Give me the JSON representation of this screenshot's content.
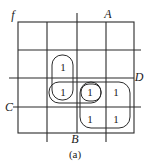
{
  "diagram": {
    "type": "karnaugh-map",
    "function_label": "f",
    "caption": "(a)",
    "variables": {
      "A": "A",
      "B": "B",
      "C": "C",
      "D": "D"
    },
    "grid": {
      "rows": 4,
      "cols": 4,
      "cells": [
        [
          "",
          "",
          "",
          ""
        ],
        [
          "",
          "1",
          "",
          ""
        ],
        [
          "",
          "1",
          "1",
          "1"
        ],
        [
          "",
          "",
          "1",
          "1"
        ]
      ]
    },
    "groupings": [
      {
        "name": "vertical-pair",
        "cells": [
          [
            1,
            1
          ],
          [
            2,
            1
          ]
        ]
      },
      {
        "name": "horizontal-pair",
        "cells": [
          [
            2,
            1
          ],
          [
            2,
            2
          ]
        ]
      },
      {
        "name": "single",
        "cells": [
          [
            2,
            2
          ]
        ]
      },
      {
        "name": "quad",
        "cells": [
          [
            2,
            2
          ],
          [
            2,
            3
          ],
          [
            3,
            2
          ],
          [
            3,
            3
          ]
        ]
      }
    ],
    "values": {
      "r1c1": "1",
      "r2c1": "1",
      "r2c2": "1",
      "r2c3": "1",
      "r3c2": "1",
      "r3c3": "1"
    }
  }
}
